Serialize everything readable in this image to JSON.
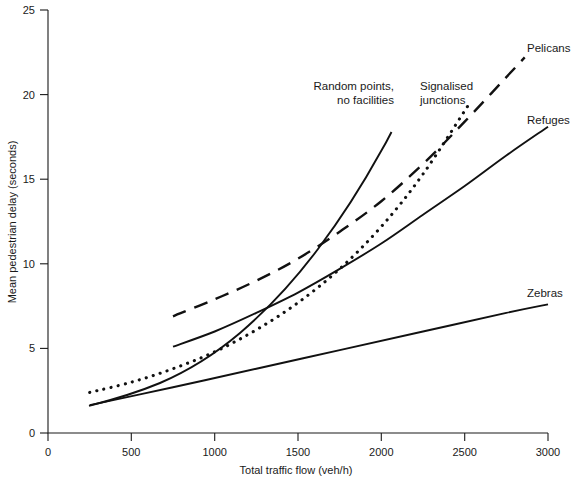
{
  "chart_data": {
    "type": "line",
    "title": "",
    "xlabel": "Total traffic flow (veh/h)",
    "ylabel": "Mean pedestrian delay (seconds)",
    "xlim": [
      0,
      3000
    ],
    "ylim": [
      0,
      25
    ],
    "xticks": [
      0,
      500,
      1000,
      1500,
      2000,
      2500,
      3000
    ],
    "yticks": [
      0,
      5,
      10,
      15,
      20,
      25
    ],
    "xtick_labels": [
      "0",
      "500",
      "1000",
      "1500",
      "2000",
      "2500",
      "3000"
    ],
    "ytick_labels": [
      "0",
      "5",
      "10",
      "15",
      "20",
      "25"
    ],
    "grid": false,
    "legend_position": "inline-annotations",
    "series": [
      {
        "name": "Random points, no facilities",
        "style": "solid",
        "x": [
          250,
          500,
          750,
          1000,
          1250,
          1500,
          1750,
          2000,
          2050
        ],
        "y": [
          1.6,
          2.6,
          3.9,
          5.6,
          7.7,
          10.3,
          13.4,
          17.4,
          18.6
        ]
      },
      {
        "name": "Signalised junctions",
        "style": "dotted",
        "x": [
          250,
          500,
          750,
          1000,
          1250,
          1500,
          1750,
          2000,
          2250,
          2530
        ],
        "y": [
          2.4,
          3.0,
          3.8,
          4.8,
          6.1,
          7.7,
          9.7,
          12.2,
          15.3,
          19.5
        ]
      },
      {
        "name": "Pelicans",
        "style": "dashed",
        "x": [
          750,
          1000,
          1250,
          1500,
          1750,
          2000,
          2250,
          2500,
          2860
        ],
        "y": [
          6.9,
          7.9,
          9.0,
          10.3,
          11.9,
          13.7,
          15.9,
          18.4,
          22.2
        ]
      },
      {
        "name": "Refuges",
        "style": "solid",
        "x": [
          750,
          1000,
          1250,
          1500,
          1750,
          2000,
          2250,
          2500,
          2750,
          3000
        ],
        "y": [
          5.1,
          6.0,
          7.1,
          8.3,
          9.7,
          11.2,
          12.9,
          14.6,
          16.4,
          18.1
        ]
      },
      {
        "name": "Zebras",
        "style": "solid",
        "x": [
          250,
          750,
          1250,
          1750,
          2250,
          2750,
          3000
        ],
        "y": [
          1.65,
          2.7,
          3.8,
          4.9,
          6.0,
          7.1,
          7.6
        ]
      }
    ],
    "annotations": [
      {
        "text_line1": "Random points,",
        "text_line2": "no facilities",
        "anchor": "end"
      },
      {
        "text_line1": "Signalised",
        "text_line2": "junctions",
        "anchor": "start"
      },
      {
        "text_line1": "Pelicans",
        "text_line2": "",
        "anchor": "start"
      },
      {
        "text_line1": "Refuges",
        "text_line2": "",
        "anchor": "start"
      },
      {
        "text_line1": "Zebras",
        "text_line2": "",
        "anchor": "start"
      }
    ]
  },
  "labels": {
    "y_axis_title": "Mean pedestrian delay (seconds)",
    "x_axis_title": "Total traffic flow (veh/h)",
    "y_25": "25",
    "y_20": "20",
    "y_15": "15",
    "y_10": "10",
    "y_5": "5",
    "y_0": "0",
    "x_0": "0",
    "x_500": "500",
    "x_1000": "1000",
    "x_1500": "1500",
    "x_2000": "2000",
    "x_2500": "2500",
    "x_3000": "3000",
    "random_points_l1": "Random points,",
    "random_points_l2": "no facilities",
    "signalised_l1": "Signalised",
    "signalised_l2": "junctions",
    "pelicans": "Pelicans",
    "refuges": "Refuges",
    "zebras": "Zebras"
  },
  "colors": {
    "ink": "#111111",
    "background": "#ffffff"
  }
}
